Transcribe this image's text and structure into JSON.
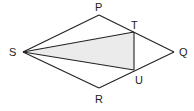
{
  "diagram": {
    "type": "geometry-kite",
    "colors": {
      "line": "#222222",
      "shade": "#ebebeb",
      "label": "#222222"
    },
    "vertices": {
      "S": {
        "label": "S",
        "x": 23,
        "y": 52
      },
      "P": {
        "label": "P",
        "x": 99,
        "y": 15
      },
      "Q": {
        "label": "Q",
        "x": 174,
        "y": 52
      },
      "R": {
        "label": "R",
        "x": 99,
        "y": 88
      },
      "T": {
        "label": "T",
        "x": 134,
        "y": 32
      },
      "U": {
        "label": "U",
        "x": 134,
        "y": 70
      }
    },
    "segments": [
      "SP",
      "PQ",
      "QR",
      "RS",
      "ST",
      "SU",
      "TU"
    ],
    "shaded_region": "STU"
  }
}
